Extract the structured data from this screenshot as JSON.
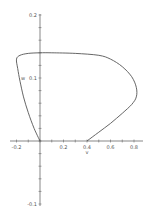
{
  "chart_data": {
    "type": "line",
    "title": "",
    "xlabel": "v",
    "ylabel": "w",
    "xlim": [
      -0.22,
      0.88
    ],
    "ylim": [
      -0.1,
      0.2
    ],
    "grid": false,
    "legend": null,
    "x_ticks": [
      -0.2,
      0.2,
      0.4,
      0.6,
      0.8
    ],
    "x_tick_labels": [
      "-0.2",
      "0.2",
      "0.4",
      "0.6",
      "0.8"
    ],
    "y_ticks": [
      0.2,
      0.1,
      -0.1
    ],
    "y_tick_labels": [
      "0.2",
      "0.1",
      "-0.1"
    ],
    "series": [
      {
        "name": "phase curve",
        "color": "#555555",
        "points": [
          [
            0.4,
            0.0
          ],
          [
            0.5,
            0.014
          ],
          [
            0.6,
            0.028
          ],
          [
            0.7,
            0.044
          ],
          [
            0.78,
            0.058
          ],
          [
            0.82,
            0.07
          ],
          [
            0.82,
            0.085
          ],
          [
            0.78,
            0.102
          ],
          [
            0.7,
            0.118
          ],
          [
            0.6,
            0.13
          ],
          [
            0.5,
            0.136
          ],
          [
            0.3,
            0.139
          ],
          [
            0.1,
            0.14
          ],
          [
            0.0,
            0.14
          ],
          [
            -0.1,
            0.139
          ],
          [
            -0.17,
            0.136
          ],
          [
            -0.2,
            0.13
          ],
          [
            -0.19,
            0.115
          ],
          [
            -0.17,
            0.095
          ],
          [
            -0.14,
            0.07
          ],
          [
            -0.1,
            0.045
          ],
          [
            -0.05,
            0.02
          ],
          [
            0.0,
            0.0
          ]
        ]
      }
    ],
    "axis_color": "#555555"
  }
}
